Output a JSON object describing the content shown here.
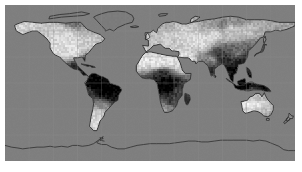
{
  "figure": {
    "title": "",
    "kind": "world-map-raster",
    "projection": "equirectangular",
    "background_color": "#ffffff",
    "margin_left_px": 5,
    "margin_top_px": 5,
    "plate_width_px": 290,
    "plate_height_px": 156
  },
  "colors": {
    "ocean": "#808080",
    "background_land_mask": "#7d7d7d",
    "coastline": "#2b2b2b",
    "graticule": "#8d8d8d",
    "high_value": "#ffffff",
    "low_value": "#000000",
    "page": "#ffffff"
  },
  "chart_data": {
    "type": "heatmap",
    "title": "",
    "subtitle": "",
    "xlabel": "",
    "ylabel": "",
    "colormap": "gray",
    "colorbar": false,
    "legend": false,
    "grid": true,
    "graticule_lon_step_deg": 30,
    "graticule_lat_step_deg": 30,
    "xlim": [
      -180,
      180
    ],
    "ylim": [
      -90,
      90
    ],
    "xtick_labels": [],
    "ytick_labels": [],
    "value_range": [
      0,
      1
    ],
    "ocean_masked": true,
    "regions": [
      {
        "name": "North America",
        "lon": -100,
        "lat": 45,
        "value": 0.95,
        "shade": "bright"
      },
      {
        "name": "Alaska",
        "lon": -152,
        "lat": 64,
        "value": 0.9,
        "shade": "bright"
      },
      {
        "name": "Greenland",
        "lon": -42,
        "lat": 72,
        "value": 0.5,
        "shade": "masked-gray"
      },
      {
        "name": "Canadian Arctic",
        "lon": -95,
        "lat": 73,
        "value": 0.5,
        "shade": "masked-gray"
      },
      {
        "name": "Central America",
        "lon": -90,
        "lat": 15,
        "value": 0.2,
        "shade": "dark"
      },
      {
        "name": "Amazon Basin",
        "lon": -62,
        "lat": -5,
        "value": 0.04,
        "shade": "very-dark"
      },
      {
        "name": "Southern Cone",
        "lon": -64,
        "lat": -35,
        "value": 0.88,
        "shade": "bright"
      },
      {
        "name": "Sahara",
        "lon": 10,
        "lat": 23,
        "value": 0.97,
        "shade": "bright"
      },
      {
        "name": "Sahel / Congo",
        "lon": 20,
        "lat": 2,
        "value": 0.06,
        "shade": "very-dark"
      },
      {
        "name": "Southern Africa",
        "lon": 25,
        "lat": -22,
        "value": 0.3,
        "shade": "dark"
      },
      {
        "name": "Madagascar",
        "lon": 47,
        "lat": -20,
        "value": 0.25,
        "shade": "dark"
      },
      {
        "name": "Europe",
        "lon": 15,
        "lat": 50,
        "value": 0.85,
        "shade": "bright"
      },
      {
        "name": "Middle East",
        "lon": 45,
        "lat": 28,
        "value": 0.95,
        "shade": "bright"
      },
      {
        "name": "Central Asia",
        "lon": 65,
        "lat": 45,
        "value": 0.93,
        "shade": "bright"
      },
      {
        "name": "Siberia",
        "lon": 100,
        "lat": 62,
        "value": 0.88,
        "shade": "bright"
      },
      {
        "name": "Tibetan Plateau",
        "lon": 88,
        "lat": 33,
        "value": 0.3,
        "shade": "dark"
      },
      {
        "name": "India",
        "lon": 78,
        "lat": 22,
        "value": 0.45,
        "shade": "mixed"
      },
      {
        "name": "Southeast Asia",
        "lon": 105,
        "lat": 12,
        "value": 0.1,
        "shade": "very-dark"
      },
      {
        "name": "Indonesia",
        "lon": 115,
        "lat": -2,
        "value": 0.05,
        "shade": "very-dark"
      },
      {
        "name": "Australia",
        "lon": 134,
        "lat": -25,
        "value": 0.96,
        "shade": "bright"
      },
      {
        "name": "New Guinea",
        "lon": 142,
        "lat": -5,
        "value": 0.08,
        "shade": "very-dark"
      },
      {
        "name": "Antarctica",
        "lon": 0,
        "lat": -80,
        "value": null,
        "shade": "outline-only"
      }
    ]
  }
}
